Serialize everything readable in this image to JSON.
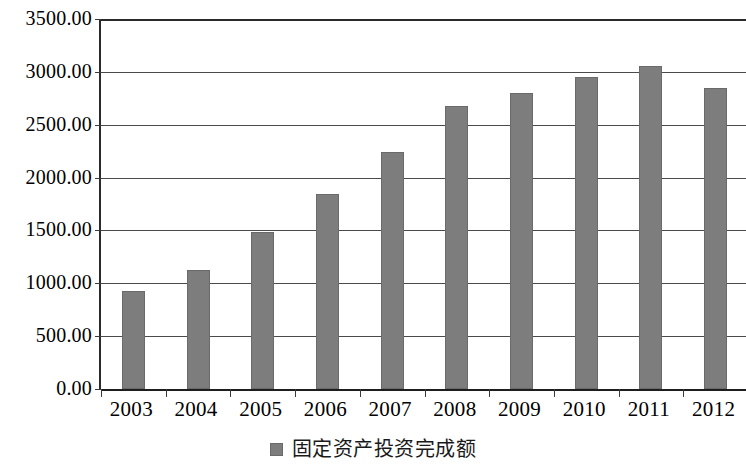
{
  "chart_data": {
    "type": "bar",
    "title": "",
    "xlabel": "",
    "ylabel": "",
    "categories": [
      "2003",
      "2004",
      "2005",
      "2006",
      "2007",
      "2008",
      "2009",
      "2010",
      "2011",
      "2012"
    ],
    "values": [
      931,
      1122,
      1483,
      1844,
      2243,
      2681,
      2804,
      2956,
      3060,
      2851
    ],
    "series": [
      {
        "name": "固定资产投资完成额",
        "color": "#7d7d7d",
        "values": [
          931,
          1122,
          1483,
          1844,
          2243,
          2681,
          2804,
          2956,
          3060,
          2851
        ]
      }
    ],
    "ylim": [
      0,
      3500
    ],
    "ytick_step": 500,
    "ytick_labels": [
      "0.00",
      "500.00",
      "1000.00",
      "1500.00",
      "2000.00",
      "2500.00",
      "3000.00",
      "3500.00"
    ],
    "ytick_values": [
      0,
      500,
      1000,
      1500,
      2000,
      2500,
      3000,
      3500
    ],
    "grid": true,
    "grid_axis": "y",
    "legend": {
      "position": "bottom-center",
      "entries": [
        {
          "label": "固定资产投资完成额",
          "color": "#7d7d7d"
        }
      ]
    },
    "bar_color": "#7d7d7d",
    "axis_color": "#2b2b2b",
    "background": "#ffffff"
  }
}
